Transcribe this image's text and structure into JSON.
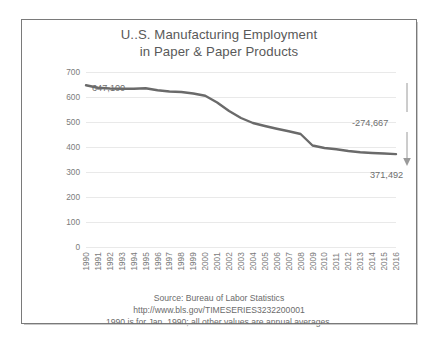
{
  "chart_data": {
    "type": "line",
    "title": "U..S. Manufacturing Employment\nin Paper & Paper Products",
    "title_lines": [
      "U..S. Manufacturing Employment",
      "in Paper & Paper Products"
    ],
    "xlabel": "",
    "ylabel": "thousands",
    "ylim": [
      0,
      700
    ],
    "yticks": [
      700,
      600,
      500,
      400,
      300,
      200,
      100,
      0
    ],
    "grid": true,
    "legend": "none",
    "line_color": "#6a6a6a",
    "categories": [
      "1990",
      "1991",
      "1992",
      "1993",
      "1994",
      "1995",
      "1996",
      "1997",
      "1998",
      "1999",
      "2000",
      "2001",
      "2002",
      "2003",
      "2004",
      "2005",
      "2006",
      "2007",
      "2008",
      "2009",
      "2010",
      "2011",
      "2012",
      "2013",
      "2014",
      "2015",
      "2016"
    ],
    "values": [
      647.1,
      637.0,
      634.0,
      633.0,
      633.0,
      635.0,
      627.0,
      622.0,
      620.0,
      614.0,
      605.0,
      578.0,
      544.0,
      516.0,
      496.0,
      484.0,
      473.0,
      463.0,
      452.0,
      406.0,
      396.0,
      391.0,
      384.0,
      379.0,
      376.0,
      374.0,
      371.5
    ],
    "annotations": [
      {
        "name": "start-value",
        "text": "647,100",
        "category": "1990",
        "value": 647.1
      },
      {
        "name": "end-value",
        "text": "371,492",
        "category": "2016",
        "value": 371.492
      },
      {
        "name": "net-change",
        "text": "-274,667",
        "value": -274.667
      }
    ]
  },
  "footer": {
    "lines": [
      "Source:  Bureau of Labor Statistics",
      "http://www.bls.gov/TIMESERIES3232200001",
      "1990 is for Jan. 1990; all other values are annual averages."
    ]
  }
}
